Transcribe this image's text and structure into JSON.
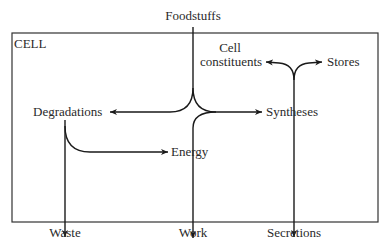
{
  "diagram": {
    "title_crop": "…tie Metabolism of Cell",
    "container_label": "CELL",
    "nodes": {
      "foodstuffs": "Foodstuffs",
      "degradations": "Degradations",
      "syntheses": "Syntheses",
      "energy": "Energy",
      "cell_constituents_line1": "Cell",
      "cell_constituents_line2": "constituents",
      "stores": "Stores",
      "waste": "Waste",
      "work": "Work",
      "secretions": "Secretions"
    },
    "edges": [
      {
        "from": "Foodstuffs",
        "to": "Degradations"
      },
      {
        "from": "Foodstuffs",
        "to": "Syntheses"
      },
      {
        "from": "Degradations",
        "to": "Energy"
      },
      {
        "from": "Degradations",
        "to": "Waste"
      },
      {
        "from": "Energy",
        "to": "Syntheses"
      },
      {
        "from": "Energy",
        "to": "Work"
      },
      {
        "from": "Syntheses",
        "to": "Cell constituents"
      },
      {
        "from": "Syntheses",
        "to": "Stores"
      },
      {
        "from": "Syntheses",
        "to": "Secretions"
      }
    ],
    "colors": {
      "line": "#1a1a1a",
      "text": "#2a2a2a",
      "background": "#ffffff"
    }
  }
}
